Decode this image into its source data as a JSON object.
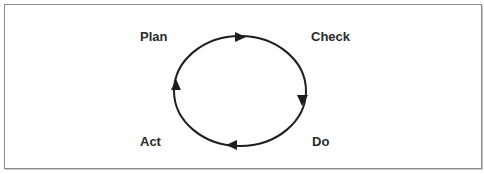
{
  "diagram": {
    "type": "cycle",
    "title": "",
    "direction": "clockwise",
    "stroke_color": "#1e1e1e",
    "text_color": "#2a2a2a",
    "border_color": "#8a8a8a",
    "nodes": [
      {
        "id": "plan",
        "label": "Plan",
        "position": "top-left"
      },
      {
        "id": "check",
        "label": "Check",
        "position": "top-right"
      },
      {
        "id": "do",
        "label": "Do",
        "position": "bottom-right"
      },
      {
        "id": "act",
        "label": "Act",
        "position": "bottom-left"
      }
    ],
    "arrows": [
      {
        "at": "top",
        "points": "right"
      },
      {
        "at": "right",
        "points": "down"
      },
      {
        "at": "bottom",
        "points": "left"
      },
      {
        "at": "left",
        "points": "up"
      }
    ]
  }
}
